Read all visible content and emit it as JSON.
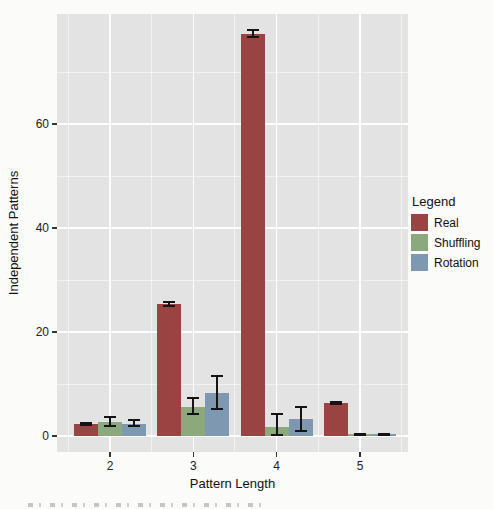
{
  "figure": {
    "background": "#FBFBFA",
    "panel_background": "#E3E3E3",
    "gridline_color": "#FFFFFF",
    "text_color": "#222222",
    "error_bar_color": "#141414"
  },
  "chart_data": {
    "type": "bar",
    "title": "",
    "xlabel": "Pattern Length",
    "ylabel": "Independent Patterns",
    "categories": [
      "2",
      "3",
      "4",
      "5"
    ],
    "series": [
      {
        "name": "Real",
        "color": "#9A4343",
        "values": [
          2.3,
          25.4,
          77.4,
          6.4
        ],
        "err_low": [
          2.15,
          25.0,
          76.7,
          6.2
        ],
        "err_high": [
          2.45,
          25.8,
          78.1,
          6.6
        ]
      },
      {
        "name": "Shuffling",
        "color": "#8BA97D",
        "values": [
          2.6,
          5.6,
          1.7,
          0.3
        ],
        "err_low": [
          1.9,
          4.2,
          0.1,
          0.15
        ],
        "err_high": [
          3.6,
          7.4,
          4.2,
          0.45
        ]
      },
      {
        "name": "Rotation",
        "color": "#7E98B2",
        "values": [
          2.4,
          8.3,
          3.3,
          0.3
        ],
        "err_low": [
          1.9,
          5.2,
          1.0,
          0.15
        ],
        "err_high": [
          3.1,
          11.5,
          5.6,
          0.45
        ]
      }
    ],
    "yticks": [
      0,
      20,
      40,
      60
    ],
    "yticks_minor": [
      10,
      30,
      50,
      70
    ],
    "ylim": [
      -3,
      81
    ],
    "grid": true,
    "error_bars": true,
    "legend": {
      "title": "Legend",
      "position": "right",
      "entries": [
        "Real",
        "Shuffling",
        "Rotation"
      ]
    }
  }
}
